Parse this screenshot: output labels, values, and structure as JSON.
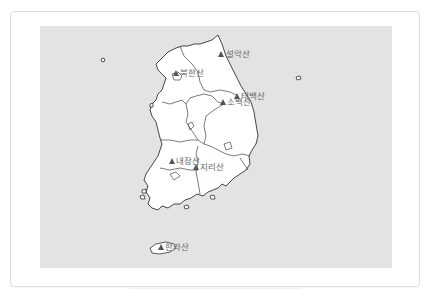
{
  "map": {
    "title": "",
    "region": "South Korea",
    "background_color": "#e3e3e3",
    "land_color": "#ffffff",
    "marker_color": "#555555",
    "label_color": "#666666",
    "mountains": [
      {
        "name": "설악산",
        "x": 221,
        "y": 54
      },
      {
        "name": "북한산",
        "x": 176,
        "y": 73
      },
      {
        "name": "태백산",
        "x": 237,
        "y": 96
      },
      {
        "name": "소백산",
        "x": 223,
        "y": 102
      },
      {
        "name": "내장산",
        "x": 172,
        "y": 161
      },
      {
        "name": "지리산",
        "x": 196,
        "y": 167
      },
      {
        "name": "한라산",
        "x": 161,
        "y": 247
      }
    ]
  }
}
